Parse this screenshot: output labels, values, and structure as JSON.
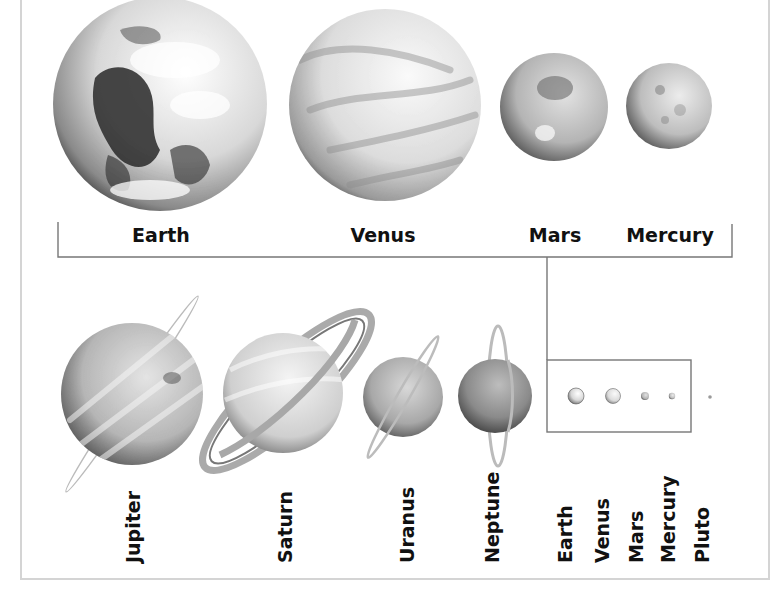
{
  "diagram": {
    "title_visible": false,
    "colors": {
      "frame": "#d4d4d4",
      "bracket": "#777777",
      "text": "#111111"
    },
    "inner_planets": [
      {
        "name": "Earth",
        "label_x": 161
      },
      {
        "name": "Venus",
        "label_x": 383
      },
      {
        "name": "Mars",
        "label_x": 555
      },
      {
        "name": "Mercury",
        "label_x": 670
      }
    ],
    "outer_planets": [
      {
        "name": "Jupiter"
      },
      {
        "name": "Saturn"
      },
      {
        "name": "Uranus"
      },
      {
        "name": "Neptune"
      }
    ],
    "scale_inset": {
      "description": "Inner planets and Pluto at the same scale as the outer planets",
      "labels": [
        "Earth",
        "Venus",
        "Mars",
        "Mercury",
        "Pluto"
      ]
    }
  }
}
